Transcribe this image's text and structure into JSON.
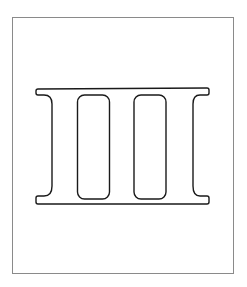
{
  "figure": {
    "stroke_color": "#1a1a1a",
    "frame_color": "#8a8a8a",
    "background": "#ffffff"
  }
}
